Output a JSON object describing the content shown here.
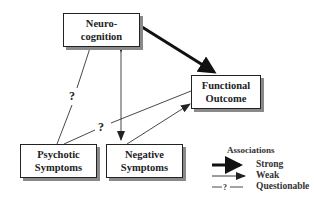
{
  "nodes": {
    "neurocognition": {
      "line1": "Neuro-",
      "line2": "cognition"
    },
    "functional_outcome": {
      "line1": "Functional",
      "line2": "Outcome"
    },
    "psychotic_symptoms": {
      "line1": "Psychotic",
      "line2": "Symptoms"
    },
    "negative_symptoms": {
      "line1": "Negative",
      "line2": "Symptoms"
    }
  },
  "edges": [
    {
      "from": "Neurocognition",
      "to": "Functional Outcome",
      "type": "strong"
    },
    {
      "from": "Neurocognition",
      "to": "Negative Symptoms",
      "type": "weak",
      "bidirectional": true
    },
    {
      "from": "Neurocognition",
      "to": "Psychotic Symptoms",
      "type": "questionable"
    },
    {
      "from": "Psychotic Symptoms",
      "to": "Functional Outcome",
      "type": "questionable"
    },
    {
      "from": "Negative Symptoms",
      "to": "Functional Outcome",
      "type": "weak"
    }
  ],
  "question_mark": "?",
  "legend": {
    "title": "Associations",
    "strong": "Strong",
    "weak": "Weak",
    "questionable": "Questionable",
    "questionable_symbol": "—?—"
  }
}
